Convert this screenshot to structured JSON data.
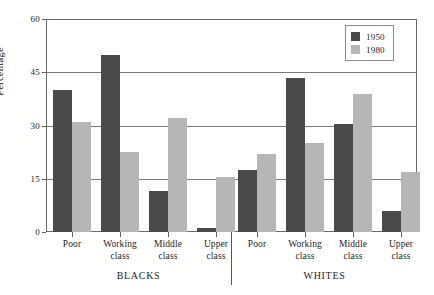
{
  "chart_data": {
    "type": "bar",
    "title": "",
    "xlabel": "",
    "ylabel": "Percentage",
    "ylim": [
      0,
      60
    ],
    "yticks": [
      0,
      15,
      30,
      45,
      60
    ],
    "ytick_labels": [
      "0",
      "15",
      "30",
      "45",
      "60"
    ],
    "grid": true,
    "legend_position": "top-right",
    "categories": [
      "Poor",
      "Working class",
      "Middle class",
      "Upper class",
      "Poor",
      "Working class",
      "Middle class",
      "Upper class"
    ],
    "group_labels": [
      "BLACKS",
      "WHITES"
    ],
    "groups": [
      {
        "name": "BLACKS",
        "categories": [
          "Poor",
          "Working class",
          "Middle class",
          "Upper class"
        ],
        "series": [
          {
            "name": "1950",
            "values": [
              40,
              50,
              11.5,
              1
            ]
          },
          {
            "name": "1980",
            "values": [
              31,
              22.5,
              32,
              15.5
            ]
          }
        ]
      },
      {
        "name": "WHITES",
        "categories": [
          "Poor",
          "Working class",
          "Middle class",
          "Upper class"
        ],
        "series": [
          {
            "name": "1950",
            "values": [
              17.5,
              43.5,
              30.5,
              6
            ]
          },
          {
            "name": "1980",
            "values": [
              22,
              25,
              39,
              17
            ]
          }
        ]
      }
    ],
    "series": [
      {
        "name": "1950",
        "color": "#4a4a4a",
        "values": [
          40,
          50,
          11.5,
          1,
          17.5,
          43.5,
          30.5,
          6
        ]
      },
      {
        "name": "1980",
        "color": "#b6b6b6",
        "values": [
          31,
          22.5,
          32,
          15.5,
          22,
          25,
          39,
          17
        ]
      }
    ]
  },
  "axis": {
    "y_title": "Percentage",
    "y_labels": [
      "60",
      "45",
      "30",
      "15",
      "0"
    ]
  },
  "x_axis": {
    "categories": [
      {
        "line1": "Poor",
        "line2": ""
      },
      {
        "line1": "Working",
        "line2": "class"
      },
      {
        "line1": "Middle",
        "line2": "class"
      },
      {
        "line1": "Upper",
        "line2": "class"
      },
      {
        "line1": "Poor",
        "line2": ""
      },
      {
        "line1": "Working",
        "line2": "class"
      },
      {
        "line1": "Middle",
        "line2": "class"
      },
      {
        "line1": "Upper",
        "line2": "class"
      }
    ]
  },
  "groups": [
    {
      "label": "BLACKS"
    },
    {
      "label": "WHITES"
    }
  ],
  "legend": {
    "items": [
      {
        "label": "1950",
        "color": "#4a4a4a",
        "swatch": "legend-swatch-1950"
      },
      {
        "label": "1980",
        "color": "#b6b6b6",
        "swatch": "legend-swatch-1980"
      }
    ]
  }
}
